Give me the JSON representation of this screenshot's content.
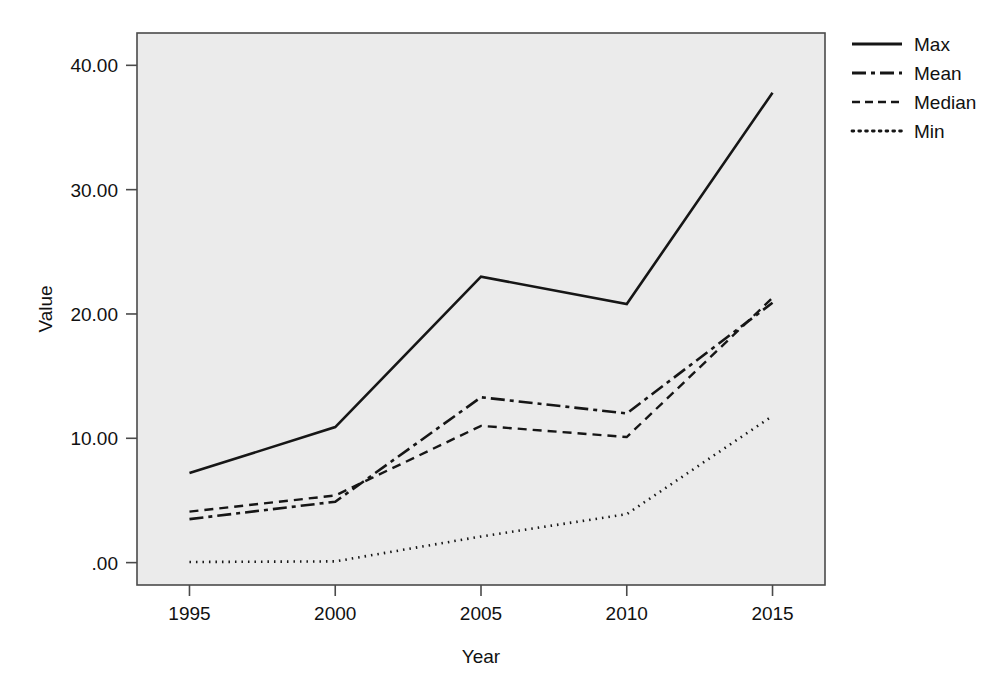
{
  "chart_data": {
    "type": "line",
    "title": "",
    "xlabel": "Year",
    "ylabel": "Value",
    "x": [
      1995,
      2000,
      2005,
      2010,
      2015
    ],
    "categories": [
      "1995",
      "2000",
      "2005",
      "2010",
      "2015"
    ],
    "xtick_labels": [
      "1995",
      "2000",
      "2005",
      "2010",
      "2015"
    ],
    "ytick_labels": [
      ".00",
      "10.00",
      "20.00",
      "30.00",
      "40.00"
    ],
    "ytick_values": [
      0,
      10,
      20,
      30,
      40
    ],
    "xlim": [
      1993.2,
      2016.8
    ],
    "ylim": [
      -1.8,
      42.6
    ],
    "grid": false,
    "legend_position": "right-top",
    "series": [
      {
        "name": "Max",
        "values": [
          7.2,
          10.9,
          23.0,
          20.8,
          37.8
        ],
        "dash": "solid",
        "stroke_width": 2.6,
        "dasharray": "",
        "color": "#161616"
      },
      {
        "name": "Mean",
        "values": [
          3.5,
          4.9,
          13.3,
          12.0,
          20.9
        ],
        "dash": "dash-dot",
        "stroke_width": 2.6,
        "dasharray": "14,5,4,5",
        "color": "#161616"
      },
      {
        "name": "Median",
        "values": [
          4.1,
          5.4,
          11.0,
          10.1,
          21.3
        ],
        "dash": "dashed",
        "stroke_width": 2.4,
        "dasharray": "9,6",
        "color": "#2e2e2e"
      },
      {
        "name": "Min",
        "values": [
          0.05,
          0.1,
          2.1,
          3.9,
          11.8
        ],
        "dash": "dotted",
        "stroke_width": 2.6,
        "dasharray": "1.5,5",
        "color": "#161616"
      }
    ],
    "legend": [
      {
        "label": "Max",
        "dasharray": "",
        "stroke_width": 2.8
      },
      {
        "label": "Mean",
        "dasharray": "14,5,4,5",
        "stroke_width": 2.8
      },
      {
        "label": "Median",
        "dasharray": "8,5",
        "stroke_width": 2.6
      },
      {
        "label": "Min",
        "dasharray": "1.8,5",
        "stroke_width": 2.8
      }
    ]
  },
  "colors": {
    "plot_background": "#ebebeb",
    "page_background": "#ffffff",
    "axis": "#4a4a4a",
    "text": "#111111",
    "line": "#161616"
  }
}
